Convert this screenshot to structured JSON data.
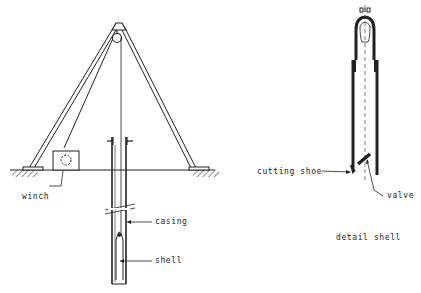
{
  "diagram": {
    "type": "technical-drawing",
    "colors": {
      "line": "#222222",
      "background": "#ffffff"
    },
    "labels": {
      "winch": "winch",
      "casing": "casing",
      "shell": "shell",
      "cutting_shoe": "cutting shoe",
      "valve": "valve",
      "detail_shell": "detail shell"
    },
    "components": [
      "tripod",
      "pulley",
      "winch",
      "ground-line",
      "casing",
      "shell",
      "cable",
      "detail-shell",
      "cutting-shoe",
      "valve"
    ]
  }
}
